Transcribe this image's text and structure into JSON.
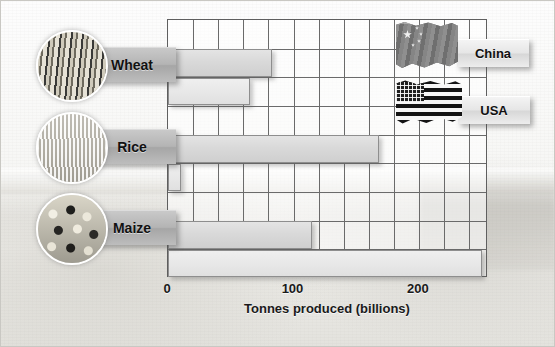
{
  "chart_data": {
    "type": "bar",
    "orientation": "horizontal",
    "title": "",
    "xlabel": "Tonnes produced (billions)",
    "ylabel": "",
    "xlim": [
      0,
      255
    ],
    "xticks": [
      0,
      100,
      200
    ],
    "xtick_labels": [
      "0",
      "100",
      "200"
    ],
    "grid": true,
    "gridline_step": 20,
    "legend_position": "top-right",
    "categories": [
      "Wheat",
      "Rice",
      "Maize"
    ],
    "series": [
      {
        "name": "China",
        "values": [
          83,
          168,
          115
        ]
      },
      {
        "name": "USA",
        "values": [
          65,
          10,
          250
        ]
      }
    ]
  },
  "crops": [
    {
      "label": "Wheat",
      "icon": "wheat-photo-icon"
    },
    {
      "label": "Rice",
      "icon": "rice-photo-icon"
    },
    {
      "label": "Maize",
      "icon": "maize-photo-icon"
    }
  ],
  "legend": [
    {
      "label": "China",
      "icon": "china-flag-icon"
    },
    {
      "label": "USA",
      "icon": "usa-flag-icon"
    }
  ],
  "axis": {
    "title": "Tonnes produced (billions)",
    "ticks": [
      "0",
      "100",
      "200"
    ]
  },
  "colors": {
    "bar_fill": "#e2e2e2",
    "bar_stroke": "#8e8e8e",
    "grid": "#6a6a6a",
    "frame": "#5f5f5f",
    "text": "#111111",
    "plaque_crop": "#b4b4b4",
    "plaque_legend": "#e6e6e6"
  }
}
